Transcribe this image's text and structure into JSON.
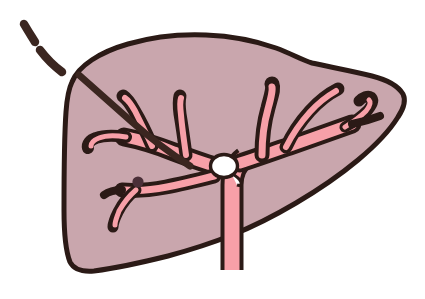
{
  "figure": {
    "title": "Liver with portal venous anatomy and percutaneous needle track",
    "subject": "liver",
    "view": "anterior schematic cross-section",
    "background_color": "#ffffff"
  },
  "colors": {
    "background": "#ffffff",
    "liver_parenchyma": "#c9a6ad",
    "liver_parenchyma_shadow": "#c09ca4",
    "vessel_lumen": "#f7a0a8",
    "outline": "#2b1a16",
    "needle": "#3b2620",
    "lesion_dot": "#4a2f38",
    "marker_circle": "#ffffff"
  },
  "structures": {
    "liver": {
      "label": "liver",
      "outline_color": "#2b1a16",
      "fill_color": "#c9a6ad",
      "outline_width_px": 5
    },
    "portal_vein_trunk": {
      "label": "portal vein trunk",
      "fill_color": "#f7a0a8",
      "position": "center-bottom, extends below inferior liver border"
    },
    "left_portal_branches": {
      "label": "left portal vein branches",
      "count": 4,
      "fill_color": "#f7a0a8"
    },
    "right_portal_branches": {
      "label": "right portal vein branches",
      "count": 4,
      "fill_color": "#f7a0a8"
    },
    "needle_track": {
      "label": "percutaneous needle / catheter",
      "color": "#3b2620",
      "style": "dashed outside liver, solid inside liver",
      "dash_segments": 2,
      "entry_point": "upper left, superior-lateral liver surface"
    },
    "marker_circle": {
      "label": "white marker at portal bifurcation",
      "fill_color": "#ffffff",
      "outline_color": "#2b1a16",
      "radius_px": 13,
      "position": "portal vein bifurcation"
    },
    "lesion_dot": {
      "label": "lesion marker on inferior left branch",
      "fill_color": "#4a2f38",
      "radius_px": 5,
      "position": "inferior left portal branch wall"
    }
  }
}
